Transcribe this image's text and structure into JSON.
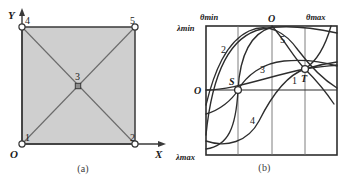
{
  "figure": {
    "panels": [
      {
        "id": "a",
        "caption": "(a)",
        "type": "mesh-diagram",
        "axes": {
          "origin_label": "O",
          "x_label": "X",
          "y_label": "Y"
        },
        "nodes": [
          {
            "id": "1",
            "label": "1",
            "x": 0,
            "y": 0,
            "marker": "circle"
          },
          {
            "id": "2",
            "label": "2",
            "x": 100,
            "y": 0,
            "marker": "circle"
          },
          {
            "id": "3",
            "label": "3",
            "x": 50,
            "y": 50,
            "marker": "square"
          },
          {
            "id": "4",
            "label": "4",
            "x": 0,
            "y": 100,
            "marker": "circle"
          },
          {
            "id": "5",
            "label": "5",
            "x": 100,
            "y": 100,
            "marker": "circle"
          }
        ],
        "edges": [
          [
            "1",
            "2"
          ],
          [
            "2",
            "5"
          ],
          [
            "5",
            "4"
          ],
          [
            "4",
            "1"
          ],
          [
            "1",
            "5"
          ],
          [
            "4",
            "2"
          ]
        ],
        "fill_color": "#cfcfcf",
        "line_color": "#3a3a3a"
      },
      {
        "id": "b",
        "caption": "(b)",
        "type": "curve-plot",
        "axis_labels": {
          "top_left": "θmin",
          "top_center": "O",
          "top_right": "θmax",
          "left_top": "λmin",
          "left_middle": "O",
          "left_bottom": "λmax"
        },
        "curve_labels": [
          {
            "name": "1",
            "x": 292,
            "y": 99
          },
          {
            "name": "2",
            "x": 226,
            "y": 51
          },
          {
            "name": "3",
            "x": 265,
            "y": 70
          },
          {
            "name": "4",
            "x": 253,
            "y": 125
          },
          {
            "name": "5",
            "x": 289,
            "y": 38
          }
        ],
        "point_labels": [
          {
            "name": "S",
            "x": 237,
            "y": 82,
            "marker": "circle"
          },
          {
            "name": "T",
            "x": 305,
            "y": 66,
            "marker": "circle"
          }
        ],
        "gridlines": {
          "vertical": 2,
          "horizontal": 1
        },
        "line_color": "#2d2d2d"
      }
    ]
  }
}
